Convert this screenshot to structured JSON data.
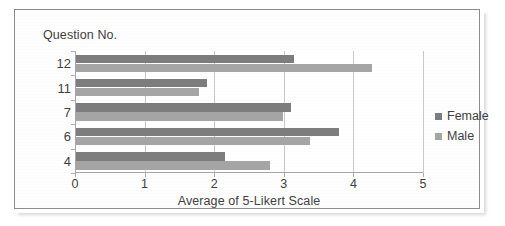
{
  "chart_data": {
    "type": "bar",
    "orientation": "horizontal",
    "title": "",
    "xlabel": "Average of 5-Likert Scale",
    "ylabel": "Question No.",
    "categories": [
      "12",
      "11",
      "7",
      "6",
      "4"
    ],
    "series": [
      {
        "name": "Female",
        "color": "#7d7d7d",
        "values": [
          3.15,
          1.9,
          3.1,
          3.8,
          2.15
        ]
      },
      {
        "name": "Male",
        "color": "#a5a5a5",
        "values": [
          4.27,
          1.78,
          2.99,
          3.38,
          2.8
        ]
      }
    ],
    "xlim": [
      0,
      5
    ],
    "xticks": [
      "0",
      "1",
      "2",
      "3",
      "4",
      "5"
    ],
    "grid": "vertical",
    "legend_position": "right"
  },
  "axes": {
    "y_title": "Question No.",
    "x_title": "Average of 5-Likert Scale"
  },
  "legend": {
    "items": [
      {
        "label": "Female",
        "color": "#7d7d7d"
      },
      {
        "label": "Male",
        "color": "#a5a5a5"
      }
    ]
  }
}
